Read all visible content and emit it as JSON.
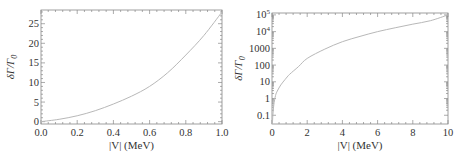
{
  "chart_data": [
    {
      "type": "line",
      "title": "",
      "xlabel": "|V| (MeV)",
      "ylabel": "δΓ/Γ0",
      "ylabel_main": "δΓ/Γ",
      "ylabel_sub": "0",
      "xlim": [
        0.0,
        1.0
      ],
      "ylim": [
        -0.6,
        28.5
      ],
      "yscale": "linear",
      "grid": false,
      "legend": null,
      "x_ticks": [
        "0.0",
        "0.2",
        "0.4",
        "0.6",
        "0.8",
        "1.0"
      ],
      "x_tick_values": [
        0.0,
        0.2,
        0.4,
        0.6,
        0.8,
        1.0
      ],
      "y_ticks": [
        "0",
        "5",
        "10",
        "15",
        "20",
        "25"
      ],
      "y_tick_values": [
        0,
        5,
        10,
        15,
        20,
        25
      ],
      "series": [
        {
          "name": "δΓ/Γ0",
          "x": [
            0.0,
            0.1,
            0.2,
            0.3,
            0.4,
            0.5,
            0.6,
            0.7,
            0.8,
            0.9,
            1.0
          ],
          "y": [
            0.0,
            0.6,
            1.5,
            2.8,
            4.5,
            6.5,
            9.0,
            12.5,
            17.0,
            22.0,
            28.0
          ]
        }
      ]
    },
    {
      "type": "line",
      "title": "",
      "xlabel": "|V| (MeV)",
      "ylabel": "δΓ/Γ0",
      "ylabel_main": "δΓ/Γ",
      "ylabel_sub": "0",
      "xlim": [
        0,
        10
      ],
      "ylim": [
        0.03,
        130000
      ],
      "yscale": "log",
      "grid": false,
      "legend": null,
      "x_ticks": [
        "0",
        "2",
        "4",
        "6",
        "8",
        "10"
      ],
      "x_tick_values": [
        0,
        2,
        4,
        6,
        8,
        10
      ],
      "y_ticks": [
        "0.1",
        "1",
        "10",
        "100",
        "1000",
        "10^4",
        "10^5"
      ],
      "y_tick_values": [
        0.1,
        1,
        10,
        100,
        1000,
        10000,
        100000
      ],
      "series": [
        {
          "name": "δΓ/Γ0",
          "x": [
            0.02,
            0.05,
            0.1,
            0.2,
            0.3,
            0.5,
            0.75,
            1,
            1.5,
            2,
            3,
            4,
            5,
            6,
            7,
            8,
            9,
            10
          ],
          "y": [
            0.03,
            0.1,
            0.4,
            1.5,
            2.8,
            6.5,
            14,
            28,
            80,
            250,
            900,
            2500,
            5200,
            10000,
            17000,
            28000,
            45000,
            100000
          ]
        }
      ]
    }
  ]
}
